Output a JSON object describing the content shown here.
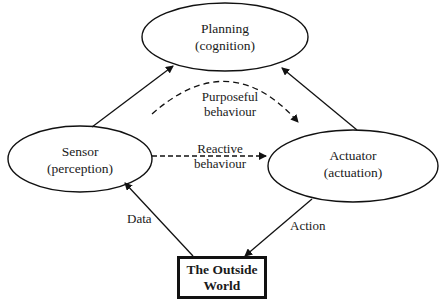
{
  "diagram": {
    "nodes": {
      "planning": {
        "title": "Planning",
        "subtitle": "(cognition)"
      },
      "sensor": {
        "title": "Sensor",
        "subtitle": "(perception)"
      },
      "actuator": {
        "title": "Actuator",
        "subtitle": "(actuation)"
      },
      "world": {
        "line1": "The Outside",
        "line2": "World"
      }
    },
    "edges": {
      "purposeful": {
        "line1": "Purposeful",
        "line2": "behaviour"
      },
      "reactive": {
        "line1": "Reactive",
        "line2": "behaviour"
      },
      "data": "Data",
      "action": "Action"
    },
    "colors": {
      "stroke": "#111111",
      "background": "#ffffff"
    }
  }
}
